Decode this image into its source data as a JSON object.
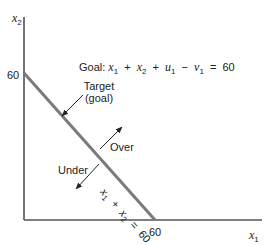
{
  "diagram": {
    "type": "goal-programming-constraint",
    "axes": {
      "x": {
        "label_var": "x",
        "label_sub": "1",
        "tick": "60"
      },
      "y": {
        "label_var": "x",
        "label_sub": "2",
        "tick": "60"
      }
    },
    "goal_equation": {
      "prefix": "Goal:",
      "terms": [
        {
          "var": "x",
          "sub": "1"
        },
        {
          "op": "+"
        },
        {
          "var": "x",
          "sub": "2"
        },
        {
          "op": "+"
        },
        {
          "var": "u",
          "sub": "1"
        },
        {
          "op": "−"
        },
        {
          "var": "v",
          "sub": "1"
        },
        {
          "op": "="
        },
        {
          "const": "60"
        }
      ]
    },
    "line_label": {
      "t1_var": "x",
      "t1_sub": "1",
      "op1": "+",
      "t2_var": "x",
      "t2_sub": "2",
      "op2": "=",
      "rhs": "60"
    },
    "annotations": {
      "target_line1": "Target",
      "target_line2": "(goal)",
      "over": "Over",
      "under": "Under"
    },
    "colors": {
      "axis": "#444444",
      "goal_line": "#7a7a7a",
      "arrow": "#222222",
      "text": "#222222"
    }
  }
}
